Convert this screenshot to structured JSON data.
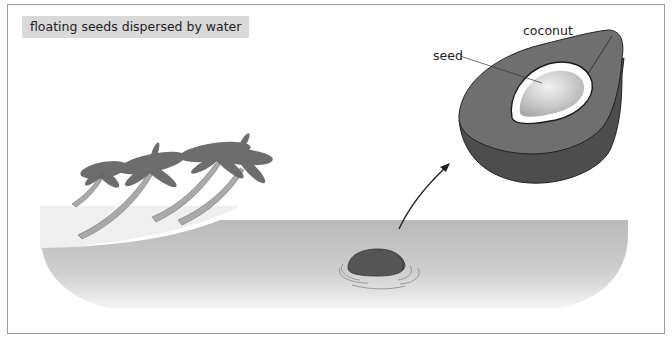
{
  "figure": {
    "title": "floating seeds dispersed by water",
    "labels": {
      "coconut": "coconut",
      "seed": "seed"
    },
    "elements": [
      {
        "name": "palm-trees",
        "count": 4,
        "description": "palm trees leaning toward the sea on a beach"
      },
      {
        "name": "beach",
        "description": "light gray sandy shore on the left"
      },
      {
        "name": "sea",
        "description": "gray water body"
      },
      {
        "name": "floating-coconut",
        "description": "coconut floating in water with ripples"
      },
      {
        "name": "arrow",
        "description": "curved arrow from floating coconut to enlarged cross-section"
      },
      {
        "name": "coconut-cross-section",
        "description": "enlarged coconut cut open showing white seed inside"
      }
    ],
    "colors": {
      "title_bg": "#d9d9d9",
      "frame": "#9a9a9a",
      "husk_top": "#6e6e6e",
      "husk_side": "#4f4f4f",
      "seed_white": "#ffffff",
      "seed_inner": "#c4c4c4",
      "water": "#bdbdbd",
      "beach": "#eeeeee",
      "palm": "#5f5f5f",
      "trunk": "#a8a8a8"
    }
  }
}
